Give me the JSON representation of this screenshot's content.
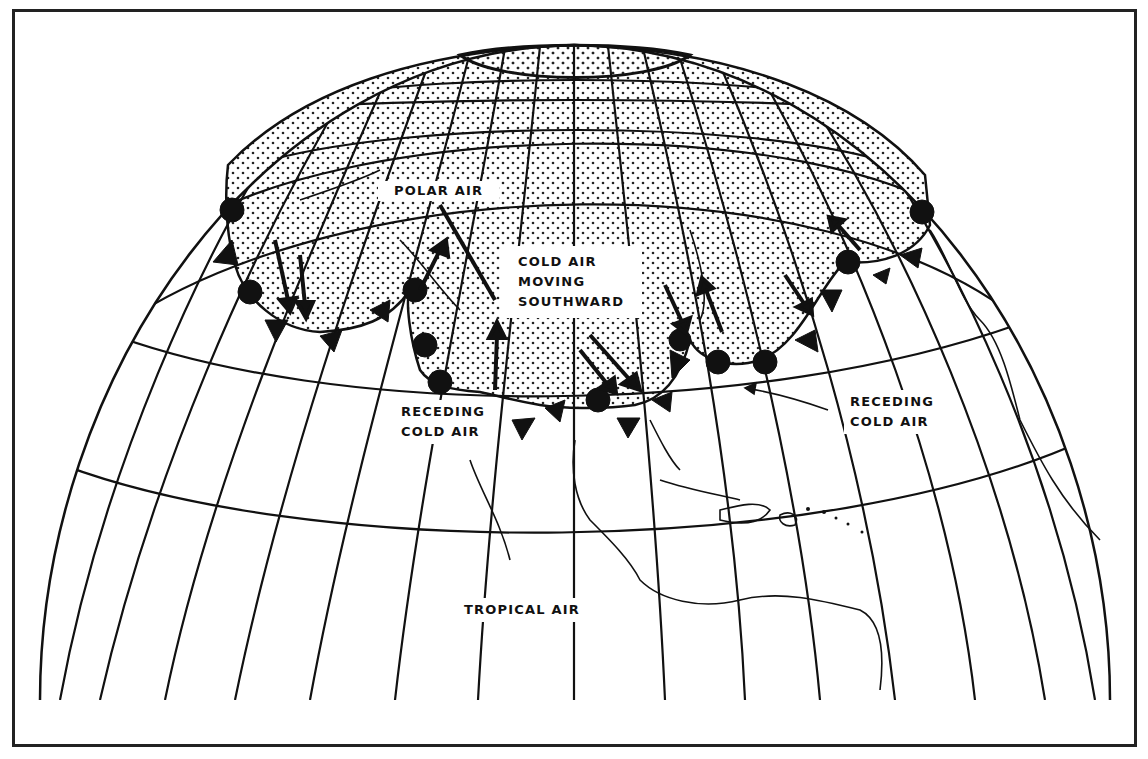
{
  "diagram": {
    "type": "weather-air-mass-map",
    "labels": {
      "polar_air": "POLAR AIR",
      "cold_air_moving": [
        "COLD AIR",
        "MOVING",
        "SOUTHWARD"
      ],
      "receding_left": [
        "RECEDING",
        "COLD AIR"
      ],
      "receding_right": [
        "RECEDING",
        "COLD AIR"
      ],
      "tropical_air": "TROPICAL AIR"
    },
    "colors": {
      "ink": "#111111",
      "background": "#ffffff",
      "stipple": "#222222"
    },
    "legend_semantics": {
      "stippled_region": "polar / cold air mass",
      "triangle_semicircle_line": "occluded / stationary front",
      "arrows": "direction of cold air movement"
    }
  }
}
